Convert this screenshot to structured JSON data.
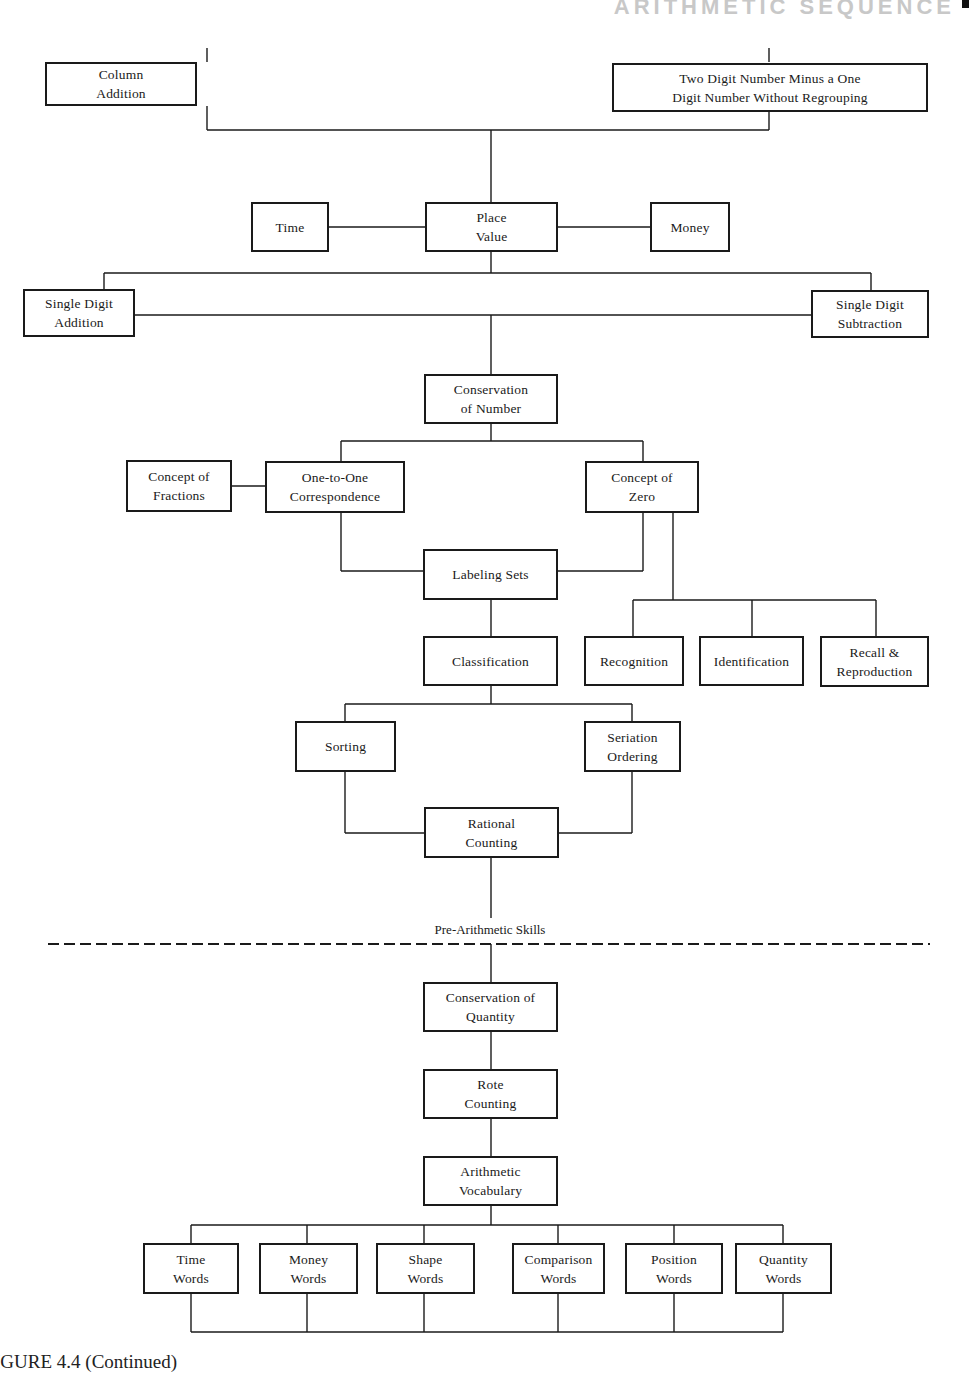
{
  "page": {
    "running_header": "ARITHMETIC SEQUENCE",
    "caption": "IGURE 4.4 (Continued)"
  },
  "divider": {
    "label": "Pre-Arithmetic Skills",
    "style": "dashed"
  },
  "nodes": {
    "column_addition": {
      "label": "Column\nAddition",
      "x": 45,
      "y": 62,
      "w": 152,
      "h": 44
    },
    "two_digit_minus": {
      "label": "Two Digit Number Minus a One\nDigit Number Without Regrouping",
      "x": 330,
      "y": 63,
      "w": 172,
      "h": 48,
      "abs_x": 612
    },
    "time": {
      "label": "Time",
      "x": 251,
      "y": 202,
      "w": 78,
      "h": 50
    },
    "place_value": {
      "label": "Place\nValue",
      "x": 425,
      "y": 202,
      "w": 133,
      "h": 50
    },
    "money": {
      "label": "Money",
      "x": 650,
      "y": 202,
      "w": 80,
      "h": 50
    },
    "single_digit_addition": {
      "label": "Single Digit\nAddition",
      "x": 23,
      "y": 289,
      "w": 112,
      "h": 48
    },
    "single_digit_subtraction": {
      "label": "Single Digit\nSubtraction",
      "x": 811,
      "y": 290,
      "w": 118,
      "h": 48
    },
    "conservation_of_number": {
      "label": "Conservation\nof Number",
      "x": 424,
      "y": 374,
      "w": 134,
      "h": 50
    },
    "concept_of_fractions": {
      "label": "Concept of\nFractions",
      "x": 126,
      "y": 460,
      "w": 106,
      "h": 52
    },
    "one_to_one": {
      "label": "One-to-One\nCorrespondence",
      "x": 265,
      "y": 461,
      "w": 140,
      "h": 52
    },
    "concept_of_zero": {
      "label": "Concept of\nZero",
      "x": 585,
      "y": 461,
      "w": 114,
      "h": 52
    },
    "labeling_sets": {
      "label": "Labeling Sets",
      "x": 423,
      "y": 549,
      "w": 135,
      "h": 51
    },
    "classification": {
      "label": "Classification",
      "x": 423,
      "y": 636,
      "w": 135,
      "h": 50
    },
    "recognition": {
      "label": "Recognition",
      "x": 584,
      "y": 636,
      "w": 100,
      "h": 50
    },
    "identification": {
      "label": "Identification",
      "x": 699,
      "y": 636,
      "w": 105,
      "h": 50
    },
    "recall_reproduction": {
      "label": "Recall &\nReproduction",
      "x": 820,
      "y": 636,
      "w": 109,
      "h": 50
    },
    "sorting": {
      "label": "Sorting",
      "x": 295,
      "y": 721,
      "w": 101,
      "h": 51
    },
    "seriation_ordering": {
      "label": "Seriation\nOrdering",
      "x": 584,
      "y": 721,
      "w": 97,
      "h": 51
    },
    "rational_counting": {
      "label": "Rational\nCounting",
      "x": 424,
      "y": 807,
      "w": 135,
      "h": 51
    },
    "conservation_of_quantity": {
      "label": "Conservation of\nQuantity",
      "x": 423,
      "y": 982,
      "w": 135,
      "h": 50
    },
    "rote_counting": {
      "label": "Rote\nCounting",
      "x": 423,
      "y": 1069,
      "w": 135,
      "h": 50
    },
    "arithmetic_vocabulary": {
      "label": "Arithmetic\nVocabulary",
      "x": 423,
      "y": 1156,
      "w": 135,
      "h": 50
    },
    "time_words": {
      "label": "Time\nWords",
      "x": 143,
      "y": 1243,
      "w": 96,
      "h": 51
    },
    "money_words": {
      "label": "Money\nWords",
      "x": 259,
      "y": 1243,
      "w": 99,
      "h": 51
    },
    "shape_words": {
      "label": "Shape\nWords",
      "x": 376,
      "y": 1243,
      "w": 99,
      "h": 51
    },
    "comparison_words": {
      "label": "Comparison\nWords",
      "x": 512,
      "y": 1243,
      "w": 93,
      "h": 51
    },
    "position_words": {
      "label": "Position\nWords",
      "x": 625,
      "y": 1243,
      "w": 98,
      "h": 51
    },
    "quantity_words": {
      "label": "Quantity\nWords",
      "x": 735,
      "y": 1243,
      "w": 97,
      "h": 51
    }
  },
  "lines": [
    [
      207,
      48,
      207,
      62
    ],
    [
      769,
      48,
      769,
      62
    ],
    [
      207,
      106,
      207,
      130
    ],
    [
      769,
      112,
      769,
      130
    ],
    [
      207,
      130,
      769,
      130
    ],
    [
      491,
      130,
      491,
      202
    ],
    [
      329,
      227,
      425,
      227
    ],
    [
      558,
      227,
      650,
      227
    ],
    [
      491,
      252,
      491,
      273
    ],
    [
      104,
      273,
      871,
      273
    ],
    [
      104,
      273,
      104,
      289
    ],
    [
      871,
      273,
      871,
      290
    ],
    [
      135,
      315,
      811,
      315
    ],
    [
      491,
      315,
      491,
      374
    ],
    [
      491,
      424,
      491,
      441
    ],
    [
      341,
      441,
      643,
      441
    ],
    [
      341,
      441,
      341,
      461
    ],
    [
      643,
      441,
      643,
      461
    ],
    [
      232,
      486,
      265,
      486
    ],
    [
      341,
      513,
      341,
      571
    ],
    [
      341,
      571,
      423,
      571
    ],
    [
      643,
      513,
      643,
      571
    ],
    [
      558,
      571,
      643,
      571
    ],
    [
      673,
      513,
      673,
      600
    ],
    [
      633,
      600,
      876,
      600
    ],
    [
      633,
      600,
      633,
      636
    ],
    [
      752,
      600,
      752,
      636
    ],
    [
      876,
      600,
      876,
      636
    ],
    [
      491,
      600,
      491,
      636
    ],
    [
      491,
      686,
      491,
      704
    ],
    [
      345,
      704,
      632,
      704
    ],
    [
      345,
      704,
      345,
      721
    ],
    [
      632,
      704,
      632,
      721
    ],
    [
      345,
      772,
      345,
      833
    ],
    [
      345,
      833,
      424,
      833
    ],
    [
      632,
      772,
      632,
      833
    ],
    [
      559,
      833,
      632,
      833
    ],
    [
      491,
      858,
      491,
      918
    ],
    [
      491,
      944,
      491,
      982
    ],
    [
      491,
      1032,
      491,
      1069
    ],
    [
      491,
      1119,
      491,
      1156
    ],
    [
      491,
      1206,
      491,
      1225
    ],
    [
      191,
      1225,
      783,
      1225
    ],
    [
      191,
      1225,
      191,
      1243
    ],
    [
      307,
      1225,
      307,
      1243
    ],
    [
      424,
      1225,
      424,
      1243
    ],
    [
      558,
      1225,
      558,
      1243
    ],
    [
      674,
      1225,
      674,
      1243
    ],
    [
      783,
      1225,
      783,
      1243
    ],
    [
      191,
      1294,
      191,
      1332
    ],
    [
      307,
      1294,
      307,
      1332
    ],
    [
      424,
      1294,
      424,
      1332
    ],
    [
      558,
      1294,
      558,
      1332
    ],
    [
      674,
      1294,
      674,
      1332
    ],
    [
      783,
      1294,
      783,
      1332
    ],
    [
      191,
      1332,
      783,
      1332
    ]
  ],
  "dashed_line": [
    48,
    944,
    930,
    944
  ]
}
